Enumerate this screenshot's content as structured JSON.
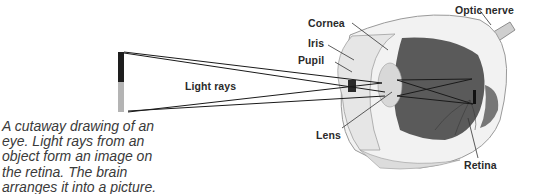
{
  "figure": {
    "title": "Cutaway drawing of an eye",
    "labels": {
      "optic_nerve": "Optic nerve",
      "cornea": "Cornea",
      "iris": "Iris",
      "pupil": "Pupil",
      "light_rays": "Light rays",
      "lens": "Lens",
      "retina": "Retina"
    },
    "caption_lines": [
      "A cutaway drawing of an",
      "eye. Light rays from an",
      "object form an image on",
      "the retina. The brain",
      "arranges it into a picture."
    ],
    "colors": {
      "object_top": "#1e1e1e",
      "object_bottom": "#b4b4b4",
      "eye_interior": "#5a5a5a",
      "sclera": "#f2f2f2",
      "ray": "#1a1a1a"
    }
  }
}
